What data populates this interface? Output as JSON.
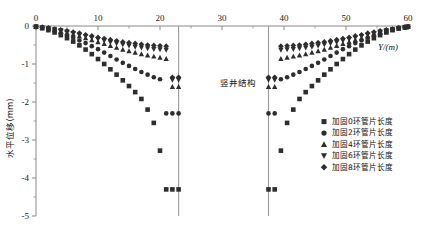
{
  "chart_data": {
    "type": "scatter",
    "title": "",
    "xlabel": "Y/(m)",
    "ylabel": "水平位移(mm)",
    "xlim": [
      0,
      60
    ],
    "ylim": [
      -5,
      0
    ],
    "xticks": [
      0,
      10,
      20,
      30,
      40,
      50,
      60
    ],
    "yticks": [
      0,
      -1,
      -2,
      -3,
      -4,
      -5
    ],
    "xticklabels": [
      "0",
      "10",
      "20",
      "30",
      "40",
      "50",
      "60"
    ],
    "yticklabels": [
      "0",
      "-1",
      "-2",
      "-3",
      "-4",
      "-5"
    ],
    "grid": false,
    "legend_position": "lower-right",
    "annotations": [
      {
        "text": "竖井结构",
        "x": 30,
        "y": -1.35
      }
    ],
    "vertical_lines": [
      {
        "x": 23.0,
        "label": "竖井结构左壁"
      },
      {
        "x": 37.5,
        "label": "竖井结构右壁"
      }
    ],
    "series": [
      {
        "name": "加固0环管片长度",
        "marker": "square",
        "color": "#2e2e2e",
        "x": [
          0,
          1,
          2,
          3,
          4,
          5,
          6,
          7,
          8,
          9,
          10,
          11,
          12,
          13,
          14,
          15,
          16,
          17,
          18,
          19,
          20,
          21,
          22,
          23,
          37.5,
          38.5,
          39.5,
          40.5,
          41.5,
          42.5,
          43.5,
          44.5,
          45.5,
          46.5,
          47.5,
          48.5,
          49.5,
          50.5,
          51.5,
          52.5,
          53.5,
          54.5,
          55.5,
          56.5,
          57.5,
          58.5,
          59.5,
          60
        ],
        "y": [
          -0.02,
          -0.06,
          -0.11,
          -0.17,
          -0.24,
          -0.32,
          -0.41,
          -0.51,
          -0.62,
          -0.74,
          -0.87,
          -1.0,
          -1.14,
          -1.28,
          -1.43,
          -1.58,
          -1.74,
          -1.92,
          -2.2,
          -2.55,
          -3.28,
          -4.3,
          -4.3,
          -4.3,
          -4.3,
          -4.3,
          -3.28,
          -2.55,
          -2.2,
          -1.92,
          -1.74,
          -1.58,
          -1.43,
          -1.28,
          -1.14,
          -1.0,
          -0.87,
          -0.74,
          -0.62,
          -0.51,
          -0.41,
          -0.32,
          -0.24,
          -0.17,
          -0.11,
          -0.06,
          -0.03,
          -0.02
        ]
      },
      {
        "name": "加固2环管片长度",
        "marker": "circle",
        "color": "#3a3a3a",
        "x": [
          0,
          1,
          2,
          3,
          4,
          5,
          6,
          7,
          8,
          9,
          10,
          11,
          12,
          13,
          14,
          15,
          16,
          17,
          18,
          19,
          20,
          21,
          22,
          23,
          37.5,
          38.5,
          39.5,
          40.5,
          41.5,
          42.5,
          43.5,
          44.5,
          45.5,
          46.5,
          47.5,
          48.5,
          49.5,
          50.5,
          51.5,
          52.5,
          53.5,
          54.5,
          55.5,
          56.5,
          57.5,
          58.5,
          59.5,
          60
        ],
        "y": [
          -0.02,
          -0.05,
          -0.09,
          -0.14,
          -0.19,
          -0.25,
          -0.31,
          -0.38,
          -0.45,
          -0.53,
          -0.61,
          -0.7,
          -0.79,
          -0.88,
          -0.97,
          -1.05,
          -1.13,
          -1.21,
          -1.28,
          -1.35,
          -1.4,
          -2.3,
          -2.3,
          -2.3,
          -2.3,
          -2.3,
          -1.4,
          -1.35,
          -1.28,
          -1.21,
          -1.13,
          -1.05,
          -0.97,
          -0.88,
          -0.79,
          -0.7,
          -0.61,
          -0.53,
          -0.45,
          -0.38,
          -0.31,
          -0.25,
          -0.19,
          -0.14,
          -0.09,
          -0.05,
          -0.03,
          -0.02
        ]
      },
      {
        "name": "加固4环管片长度",
        "marker": "triangle-up",
        "color": "#3a3a3a",
        "x": [
          0,
          1,
          2,
          3,
          4,
          5,
          6,
          7,
          8,
          9,
          10,
          11,
          12,
          13,
          14,
          15,
          16,
          17,
          18,
          19,
          20,
          21,
          22,
          23,
          37.5,
          38.5,
          39.5,
          40.5,
          41.5,
          42.5,
          43.5,
          44.5,
          45.5,
          46.5,
          47.5,
          48.5,
          49.5,
          50.5,
          51.5,
          52.5,
          53.5,
          54.5,
          55.5,
          56.5,
          57.5,
          58.5,
          59.5,
          60
        ],
        "y": [
          -0.02,
          -0.04,
          -0.07,
          -0.1,
          -0.14,
          -0.18,
          -0.22,
          -0.27,
          -0.32,
          -0.37,
          -0.42,
          -0.47,
          -0.52,
          -0.57,
          -0.62,
          -0.66,
          -0.7,
          -0.74,
          -0.77,
          -0.8,
          -0.83,
          -0.86,
          -1.6,
          -1.6,
          -1.6,
          -1.6,
          -0.86,
          -0.83,
          -0.8,
          -0.77,
          -0.74,
          -0.7,
          -0.66,
          -0.62,
          -0.57,
          -0.52,
          -0.47,
          -0.42,
          -0.37,
          -0.32,
          -0.27,
          -0.22,
          -0.18,
          -0.14,
          -0.1,
          -0.07,
          -0.04,
          -0.02
        ]
      },
      {
        "name": "加固6环管片长度",
        "marker": "triangle-down",
        "color": "#3f3f3f",
        "x": [
          0,
          1,
          2,
          3,
          4,
          5,
          6,
          7,
          8,
          9,
          10,
          11,
          12,
          13,
          14,
          15,
          16,
          17,
          18,
          19,
          20,
          21,
          22,
          23,
          37.5,
          38.5,
          39.5,
          40.5,
          41.5,
          42.5,
          43.5,
          44.5,
          45.5,
          46.5,
          47.5,
          48.5,
          49.5,
          50.5,
          51.5,
          52.5,
          53.5,
          54.5,
          55.5,
          56.5,
          57.5,
          58.5,
          59.5,
          60
        ],
        "y": [
          -0.02,
          -0.04,
          -0.06,
          -0.09,
          -0.12,
          -0.15,
          -0.19,
          -0.23,
          -0.27,
          -0.31,
          -0.35,
          -0.39,
          -0.43,
          -0.46,
          -0.49,
          -0.52,
          -0.55,
          -0.57,
          -0.59,
          -0.61,
          -0.62,
          -0.63,
          -1.42,
          -1.42,
          -1.42,
          -1.42,
          -0.63,
          -0.62,
          -0.61,
          -0.59,
          -0.57,
          -0.55,
          -0.52,
          -0.49,
          -0.46,
          -0.43,
          -0.39,
          -0.35,
          -0.31,
          -0.27,
          -0.23,
          -0.19,
          -0.15,
          -0.12,
          -0.09,
          -0.06,
          -0.04,
          -0.02
        ]
      },
      {
        "name": "加固8环管片长度",
        "marker": "diamond",
        "color": "#454545",
        "x": [
          0,
          1,
          2,
          3,
          4,
          5,
          6,
          7,
          8,
          9,
          10,
          11,
          12,
          13,
          14,
          15,
          16,
          17,
          18,
          19,
          20,
          21,
          22,
          23,
          37.5,
          38.5,
          39.5,
          40.5,
          41.5,
          42.5,
          43.5,
          44.5,
          45.5,
          46.5,
          47.5,
          48.5,
          49.5,
          50.5,
          51.5,
          52.5,
          53.5,
          54.5,
          55.5,
          56.5,
          57.5,
          58.5,
          59.5,
          60
        ],
        "y": [
          -0.02,
          -0.03,
          -0.05,
          -0.08,
          -0.1,
          -0.13,
          -0.16,
          -0.19,
          -0.23,
          -0.26,
          -0.3,
          -0.33,
          -0.36,
          -0.39,
          -0.42,
          -0.44,
          -0.46,
          -0.48,
          -0.5,
          -0.51,
          -0.52,
          -0.53,
          -1.35,
          -1.35,
          -1.35,
          -1.35,
          -0.53,
          -0.52,
          -0.51,
          -0.5,
          -0.48,
          -0.46,
          -0.44,
          -0.42,
          -0.39,
          -0.36,
          -0.33,
          -0.3,
          -0.26,
          -0.23,
          -0.19,
          -0.16,
          -0.13,
          -0.1,
          -0.08,
          -0.05,
          -0.03,
          -0.02
        ]
      }
    ]
  },
  "legend": {
    "items": [
      {
        "label": "加固0环管片长度",
        "marker": "square"
      },
      {
        "label": "加固2环管片长度",
        "marker": "circle"
      },
      {
        "label": "加固4环管片长度",
        "marker": "triangle-up"
      },
      {
        "label": "加固6环管片长度",
        "marker": "triangle-down"
      },
      {
        "label": "加固8环管片长度",
        "marker": "diamond"
      }
    ]
  },
  "axes": {
    "x_title": "Y/(m)",
    "y_title": "水平位移(mm)"
  },
  "annotation": {
    "shaft_label": "竖井结构"
  }
}
